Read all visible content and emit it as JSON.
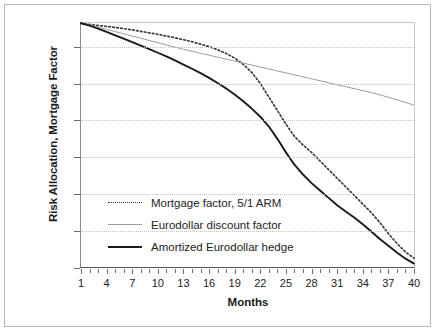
{
  "chart_data": {
    "type": "line",
    "title": "",
    "xlabel": "Months",
    "ylabel": "Risk Allocation, Mortgage Factor",
    "xlim": [
      1,
      40
    ],
    "ylim": [
      0,
      100
    ],
    "grid": true,
    "legend_position": "inside-lower-left",
    "x_tick_labels": [
      "1",
      "4",
      "7",
      "10",
      "13",
      "16",
      "19",
      "22",
      "25",
      "28",
      "31",
      "34",
      "37",
      "40"
    ],
    "x_tick_values": [
      1,
      4,
      7,
      10,
      13,
      16,
      19,
      22,
      25,
      28,
      31,
      34,
      37,
      40
    ],
    "y_tick_labels": [
      "0%",
      "15%",
      "30%",
      "45%",
      "60%",
      "75%",
      "90%"
    ],
    "y_tick_values": [
      0,
      15,
      30,
      45,
      60,
      75,
      90
    ],
    "x": [
      1,
      2,
      3,
      4,
      5,
      6,
      7,
      8,
      9,
      10,
      11,
      12,
      13,
      14,
      15,
      16,
      17,
      18,
      19,
      20,
      21,
      22,
      23,
      24,
      25,
      26,
      27,
      28,
      29,
      30,
      31,
      32,
      33,
      34,
      35,
      36,
      37,
      38,
      39,
      40
    ],
    "series": [
      {
        "name": "Mortgage factor, 5/1 ARM",
        "style": "dotted",
        "color": "#3a3a3a",
        "values": [
          99.5,
          99.0,
          98.6,
          98.2,
          97.8,
          97.3,
          96.8,
          96.2,
          95.6,
          95.0,
          94.3,
          93.6,
          92.8,
          92.0,
          91.0,
          90.0,
          88.7,
          87.2,
          85.3,
          82.8,
          79.5,
          75.0,
          69.5,
          64.0,
          58.5,
          53.5,
          50.0,
          47.0,
          43.5,
          40.0,
          36.5,
          33.0,
          29.5,
          26.0,
          22.5,
          18.5,
          14.0,
          10.0,
          6.5,
          4.0
        ]
      },
      {
        "name": "Eurodollar discount factor",
        "style": "solid",
        "color": "#9c9c9c",
        "values": [
          99.7,
          98.8,
          97.9,
          97.0,
          96.1,
          95.2,
          94.3,
          93.4,
          92.5,
          91.6,
          90.7,
          89.8,
          88.9,
          88.1,
          87.3,
          86.5,
          85.7,
          84.9,
          84.1,
          83.3,
          82.5,
          81.7,
          80.9,
          80.1,
          79.3,
          78.5,
          77.7,
          76.9,
          76.1,
          75.3,
          74.5,
          73.7,
          72.9,
          72.1,
          71.3,
          70.4,
          69.4,
          68.4,
          67.3,
          66.2
        ]
      },
      {
        "name": "Amortized Eurodollar hedge",
        "style": "solid",
        "color": "#1a1a1a",
        "values": [
          99.5,
          98.5,
          97.3,
          96.0,
          94.6,
          93.2,
          91.8,
          90.4,
          89.0,
          87.5,
          86.0,
          84.4,
          82.7,
          81.0,
          79.2,
          77.3,
          75.2,
          73.0,
          70.5,
          67.8,
          64.8,
          61.5,
          57.5,
          52.5,
          47.0,
          42.0,
          38.0,
          34.5,
          31.5,
          28.5,
          25.5,
          23.0,
          20.5,
          17.8,
          14.8,
          11.8,
          9.0,
          6.3,
          3.8,
          1.8
        ]
      }
    ]
  },
  "legend": {
    "items": [
      {
        "label": "Mortgage factor, 5/1 ARM",
        "style": "dotted",
        "color": "#3a3a3a"
      },
      {
        "label": "Eurodollar discount factor",
        "style": "solid",
        "color": "#9c9c9c"
      },
      {
        "label": "Amortized Eurodollar hedge",
        "style": "solid",
        "color": "#1a1a1a"
      }
    ]
  },
  "colors": {
    "mortgage_factor": "#3a3a3a",
    "eurodollar_discount": "#9c9c9c",
    "amortized_hedge": "#1a1a1a",
    "gridline": "#c2c2c2",
    "axis": "#555555",
    "frame": "#b8b8b8",
    "text": "#1a1a1a",
    "background": "#ffffff"
  }
}
